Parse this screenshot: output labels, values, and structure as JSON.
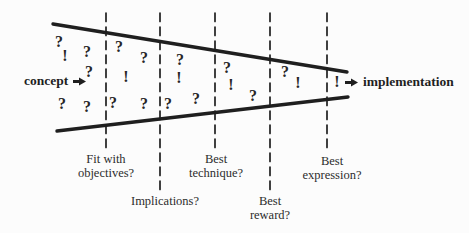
{
  "palette": {
    "ink": "#1f1f1f",
    "background": "#fcfcfc"
  },
  "concept": {
    "label": "concept"
  },
  "implementation": {
    "label": "implementation"
  },
  "funnel": {
    "top_line": {
      "x1": 53,
      "y1": 24,
      "x2": 347,
      "y2": 72
    },
    "bottom_line": {
      "x1": 57,
      "y1": 131,
      "x2": 348,
      "y2": 97
    }
  },
  "stages": [
    {
      "label": "Fit with\nobjectives?",
      "line_x": 106,
      "line_top": 13,
      "line_bottom": 148,
      "label_x": 106,
      "label_y": 153
    },
    {
      "label": "Implications?",
      "line_x": 160,
      "line_top": 13,
      "line_bottom": 190,
      "label_x": 165,
      "label_y": 195
    },
    {
      "label": "Best\ntechnique?",
      "line_x": 215,
      "line_top": 13,
      "line_bottom": 148,
      "label_x": 216,
      "label_y": 153
    },
    {
      "label": "Best\nreward?",
      "line_x": 270,
      "line_top": 13,
      "line_bottom": 190,
      "label_x": 270,
      "label_y": 195
    },
    {
      "label": "Best\nexpression?",
      "line_x": 327,
      "line_top": 13,
      "line_bottom": 150,
      "label_x": 332,
      "label_y": 155
    }
  ],
  "marks": [
    {
      "char": "?",
      "x": 59,
      "y": 42
    },
    {
      "char": "!",
      "x": 65,
      "y": 56
    },
    {
      "char": "?",
      "x": 87,
      "y": 52
    },
    {
      "char": "?",
      "x": 89,
      "y": 72
    },
    {
      "char": "?",
      "x": 62,
      "y": 104
    },
    {
      "char": "?",
      "x": 87,
      "y": 107
    },
    {
      "char": "?",
      "x": 119,
      "y": 47
    },
    {
      "char": "?",
      "x": 144,
      "y": 58
    },
    {
      "char": "!",
      "x": 126,
      "y": 77
    },
    {
      "char": "?",
      "x": 113,
      "y": 103
    },
    {
      "char": "?",
      "x": 144,
      "y": 104
    },
    {
      "char": "?",
      "x": 180,
      "y": 60
    },
    {
      "char": "!",
      "x": 179,
      "y": 78
    },
    {
      "char": "?",
      "x": 168,
      "y": 104
    },
    {
      "char": "?",
      "x": 196,
      "y": 99
    },
    {
      "char": "?",
      "x": 227,
      "y": 68
    },
    {
      "char": "!",
      "x": 231,
      "y": 85
    },
    {
      "char": "?",
      "x": 253,
      "y": 96
    },
    {
      "char": "?",
      "x": 285,
      "y": 72
    },
    {
      "char": "!",
      "x": 298,
      "y": 83
    },
    {
      "char": "!",
      "x": 337,
      "y": 82
    }
  ]
}
